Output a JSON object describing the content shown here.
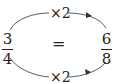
{
  "left_fraction": {
    "numerator": "3",
    "denominator": "4"
  },
  "right_fraction": {
    "numerator": "6",
    "denominator": "8"
  },
  "equals": "=",
  "top_arrow_label": "×2",
  "bottom_arrow_label": "×2",
  "colors": {
    "ink": "#222222",
    "background": "#ffffff"
  }
}
